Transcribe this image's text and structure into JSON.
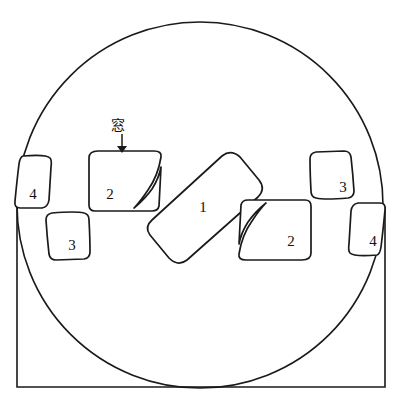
{
  "figure": {
    "kind": "technical-line-drawing",
    "background_color": "#ffffff",
    "stroke_color": "#1a1a1a",
    "width": 401,
    "height": 403
  },
  "annotation": {
    "window_label": "窓",
    "window_label_x": 118,
    "window_label_y": 125,
    "arrow_from_y": 134,
    "arrow_to_y": 152,
    "arrow_x": 122
  },
  "outer_frame": {
    "name": "rectangle-enclosure",
    "left": 17,
    "top": 207,
    "right": 385,
    "bottom": 387
  },
  "circle": {
    "name": "circular-boundary",
    "cx": 200,
    "cy": 205,
    "r": 183
  },
  "parts": [
    {
      "id": "part-1",
      "label": "1",
      "x": 203,
      "y": 207
    },
    {
      "id": "part-2-left",
      "label": "2",
      "x": 110,
      "y": 194
    },
    {
      "id": "part-2-right",
      "label": "2",
      "x": 291,
      "y": 241
    },
    {
      "id": "part-3-left",
      "label": "3",
      "x": 72,
      "y": 245
    },
    {
      "id": "part-3-right",
      "label": "3",
      "x": 343,
      "y": 187
    },
    {
      "id": "part-4-left",
      "label": "4",
      "x": 33,
      "y": 194
    },
    {
      "id": "part-4-right",
      "label": "4",
      "x": 373,
      "y": 241
    }
  ],
  "geometry": {
    "part_1_path": "M 151 219 L 223 157 Q 232 150 241 157 L 259 180 Q 265 188 257 196 L 185 258 Q 176 265 167 257 L 149 234 Q 143 226 151 219 Z",
    "part_2_left_path": "M 97 152 L 157 152 Q 163 152 162 158 Q 160 180 148 196 Q 139 207 134 212 L 96 212 Q 91 212 91 207 L 91 161 Q 91 152 97 152 Z",
    "part_2_right_path": "M 303 259 L 243 259 Q 237 259 238 253 Q 240 231 252 215 Q 261 204 266 199 L 304 199 Q 309 199 309 204 L 309 250 Q 309 259 303 259 Z",
    "part_3_left_path": "M 52 215 L 85 215 Q 90 215 90 220 L 90 250 Q 90 258 85 258 L 52 258 Q 47 258 47 253 L 47 220 Q 47 215 52 215 Z",
    "part_3_right_path": "M 348 196 L 315 196 Q 310 196 310 191 L 310 161 Q 310 153 315 153 L 348 153 Q 353 153 353 158 L 353 191 Q 353 196 348 196 Z",
    "part_4_left_path": "M 22 157 L 47 157 Q 52 157 52 162 L 52 203 Q 52 208 47 208 L 22 208 Q 17 208 17 203 L 17 162 Q 17 157 22 157 Z",
    "part_4_right_path": "M 378 254 L 353 254 Q 348 254 348 249 L 348 208 Q 348 203 353 203 L 378 203 Q 383 203 383 208 L 383 249 Q 383 254 378 254 Z"
  }
}
